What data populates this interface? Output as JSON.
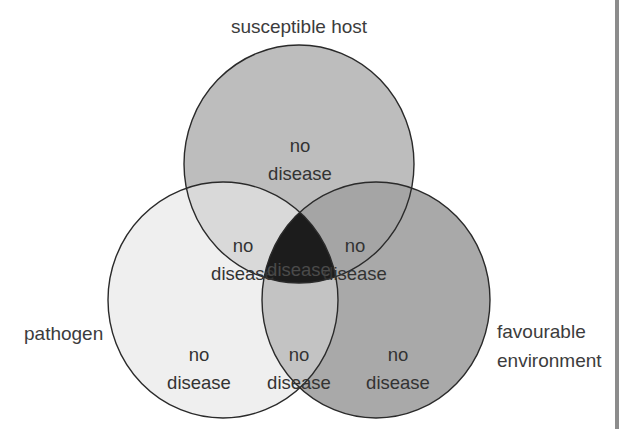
{
  "diagram": {
    "type": "venn",
    "sets": {
      "host": {
        "label": "susceptible host",
        "color": "#bdbdbd"
      },
      "pathogen": {
        "label": "pathogen",
        "color": "#efefef"
      },
      "environment": {
        "label_line1": "favourable",
        "label_line2": "environment",
        "color": "#a9a9a9"
      }
    },
    "regions": {
      "host_only": {
        "line1": "no",
        "line2": "disease",
        "color": "#bdbdbd"
      },
      "pathogen_only": {
        "line1": "no",
        "line2": "disease",
        "color": "#efefef"
      },
      "environment_only": {
        "line1": "no",
        "line2": "disease",
        "color": "#a9a9a9"
      },
      "host_pathogen": {
        "line1": "no",
        "line2": "disease",
        "color": "#d9d9d9"
      },
      "host_environment": {
        "line1": "no",
        "line2": "disease",
        "color": "#a5a5a5"
      },
      "pathogen_environment": {
        "line1": "no",
        "line2": "disease",
        "color": "#c3c3c3"
      },
      "all_three": {
        "line1": "disease",
        "color": "#1c1c1c"
      }
    },
    "outline_color": "#2a2a2a",
    "side_bar_color": "#8c8c8c"
  }
}
